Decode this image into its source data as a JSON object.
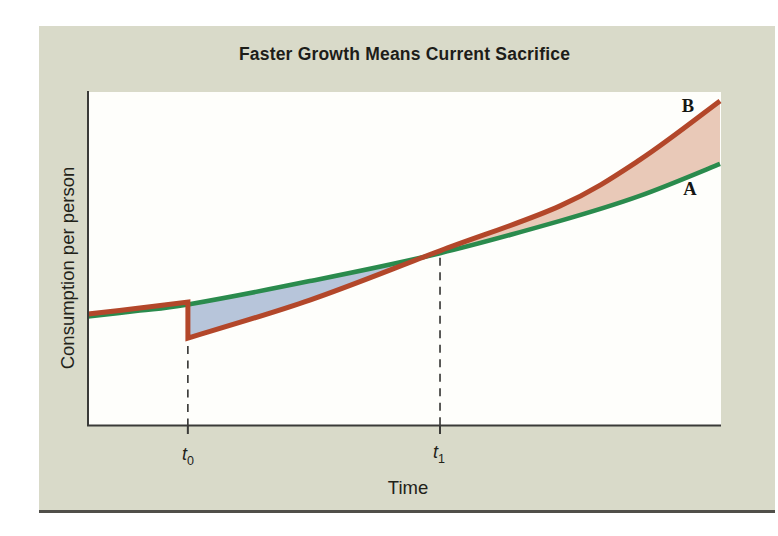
{
  "figure": {
    "title": "Faster Growth Means Current Sacrifice",
    "colors": {
      "panel_background": "#d9dac9",
      "plot_background": "#fefefb",
      "axis": "#3a3a38",
      "bottom_rule": "#504f49",
      "dashed_guide": "#3f3f3d"
    }
  },
  "chart_data": {
    "type": "line",
    "title": "Faster Growth Means Current Sacrifice",
    "xlabel": "Time",
    "ylabel": "Consumption per person",
    "x_range": [
      0,
      10
    ],
    "y_range": [
      0,
      100
    ],
    "grid": false,
    "axes_shown": [
      "left",
      "bottom"
    ],
    "legend": "labels at right end of curves",
    "series": [
      {
        "name": "A",
        "label": "A",
        "color": "#2a8b4d",
        "description": "Original consumption growth path",
        "points": [
          [
            0,
            33.0
          ],
          [
            0.82,
            34.8
          ],
          [
            1.58,
            36.6
          ],
          [
            3.51,
            43.2
          ],
          [
            5.57,
            52.0
          ],
          [
            7.47,
            61.3
          ],
          [
            8.73,
            68.8
          ],
          [
            10,
            78.4
          ]
        ]
      },
      {
        "name": "B",
        "label": "B",
        "color": "#b3472a",
        "description": "Faster-growth path: consumption drops at t0, overtakes A at t1",
        "points": [
          [
            0,
            33.0
          ],
          [
            0.82,
            34.8
          ],
          [
            1.58,
            36.6
          ],
          [
            1.58,
            26.1
          ],
          [
            3.51,
            37.5
          ],
          [
            5.57,
            52.0
          ],
          [
            7.47,
            65.8
          ],
          [
            8.73,
            79.6
          ],
          [
            10,
            97.3
          ]
        ]
      }
    ],
    "x_ticks": [
      {
        "base": "t",
        "sub": "0",
        "t": 1.58,
        "dash_from": 23.7
      },
      {
        "base": "t",
        "sub": "1",
        "t": 5.57,
        "dash_from": 50.2
      }
    ],
    "fills": [
      {
        "name": "current-sacrifice-region",
        "color": "#b7c5da",
        "upper": "A",
        "lower": "B",
        "from_t": 1.58,
        "to_t": 5.57
      },
      {
        "name": "future-gain-region",
        "color": "#e9c9b8",
        "upper": "B",
        "lower": "A",
        "from_t": 5.57,
        "to_t": 10
      }
    ]
  }
}
